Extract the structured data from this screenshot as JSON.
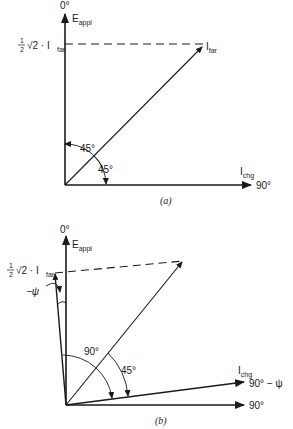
{
  "diagram_a": {
    "caption": "(a)",
    "top_angle": "0°",
    "vertical_label": "E",
    "vertical_label_sub": "appl",
    "projection_label_frac_num": "1",
    "projection_label_frac_den": "2",
    "projection_label_rest": "√2 · I",
    "projection_label_sub": "far",
    "diagonal_label": "I",
    "diagonal_label_sub": "far",
    "horizontal_label": "I",
    "horizontal_label_sub": "chg",
    "horizontal_angle": "90°",
    "angle_upper": "45°",
    "angle_lower": "45°"
  },
  "diagram_b": {
    "caption": "(b)",
    "top_angle": "0°",
    "vertical_label": "E",
    "vertical_label_sub": "appl",
    "projection_label_frac_num": "1",
    "projection_label_frac_den": "2",
    "projection_label_rest": "√2 · I",
    "projection_label_sub": "far",
    "psi_label": "−ψ",
    "angle_90": "90°",
    "angle_45": "45°",
    "tilted_horizontal_label": "I",
    "tilted_horizontal_label_sub": "chg",
    "tilted_horizontal_angle": "90° − ψ",
    "horizontal_angle": "90°"
  }
}
